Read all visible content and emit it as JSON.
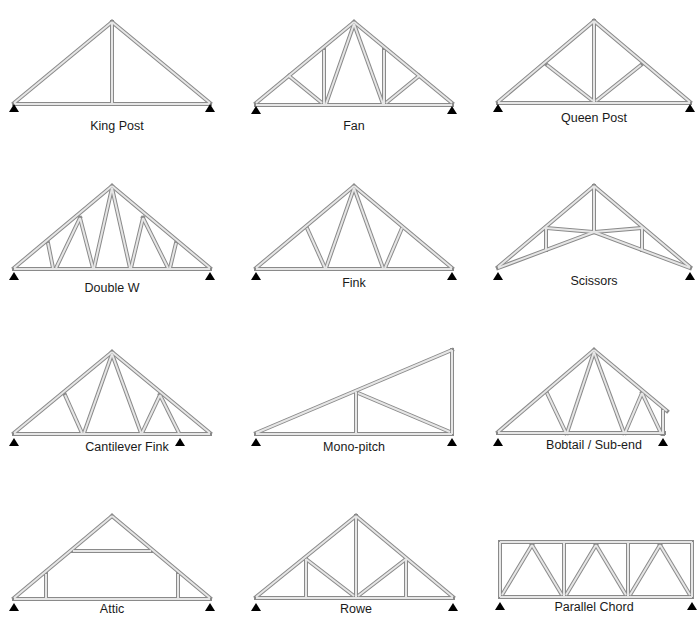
{
  "diagram": {
    "style": {
      "member_outline": "#8a8a8a",
      "member_fill": "#e6e6e6",
      "member_width": 4,
      "support_color": "#000000",
      "label_color": "#1a1a1a"
    },
    "trusses": [
      {
        "name": "King Post",
        "label_pos": [
          117,
          128
        ],
        "supports": [
          [
            14,
            106
          ],
          [
            210,
            106
          ]
        ],
        "members": [
          [
            [
              14,
              103
            ],
            [
              112,
              22
            ]
          ],
          [
            [
              112,
              22
            ],
            [
              210,
              103
            ]
          ],
          [
            [
              14,
              104
            ],
            [
              210,
              104
            ]
          ],
          [
            [
              112,
              22
            ],
            [
              112,
              104
            ]
          ]
        ]
      },
      {
        "name": "Fan",
        "label_pos": [
          354,
          128
        ],
        "supports": [
          [
            256,
            108
          ],
          [
            452,
            108
          ]
        ],
        "members": [
          [
            [
              256,
              103
            ],
            [
              354,
              22
            ]
          ],
          [
            [
              354,
              22
            ],
            [
              452,
              103
            ]
          ],
          [
            [
              256,
              105
            ],
            [
              452,
              105
            ]
          ],
          [
            [
              289,
              76
            ],
            [
              322,
              103
            ]
          ],
          [
            [
              324,
              50
            ],
            [
              324,
              104
            ]
          ],
          [
            [
              354,
              24
            ],
            [
              326,
              104
            ]
          ],
          [
            [
              354,
              24
            ],
            [
              383,
              104
            ]
          ],
          [
            [
              384,
              50
            ],
            [
              384,
              104
            ]
          ],
          [
            [
              419,
              76
            ],
            [
              386,
              103
            ]
          ]
        ]
      },
      {
        "name": "Queen Post",
        "label_pos": [
          594,
          120
        ],
        "supports": [
          [
            498,
            106
          ],
          [
            690,
            106
          ]
        ],
        "members": [
          [
            [
              498,
              102
            ],
            [
              594,
              21
            ]
          ],
          [
            [
              594,
              21
            ],
            [
              690,
              102
            ]
          ],
          [
            [
              498,
              103
            ],
            [
              690,
              103
            ]
          ],
          [
            [
              594,
              21
            ],
            [
              594,
              103
            ]
          ],
          [
            [
              547,
              65
            ],
            [
              593,
              101
            ]
          ],
          [
            [
              641,
              65
            ],
            [
              596,
              101
            ]
          ]
        ]
      }
    ],
    "trusses_row2": [
      {
        "name": "Double W",
        "label_pos": [
          112,
          290
        ],
        "supports": [
          [
            14,
            274
          ],
          [
            210,
            274
          ]
        ],
        "members": [
          [
            [
              14,
              268
            ],
            [
              112,
              186
            ]
          ],
          [
            [
              112,
              186
            ],
            [
              210,
              268
            ]
          ],
          [
            [
              14,
              269
            ],
            [
              210,
              269
            ]
          ],
          [
            [
              48,
              243
            ],
            [
              53,
              268
            ]
          ],
          [
            [
              80,
              218
            ],
            [
              56,
              268
            ]
          ],
          [
            [
              80,
              218
            ],
            [
              93,
              268
            ]
          ],
          [
            [
              112,
              188
            ],
            [
              94,
              268
            ]
          ],
          [
            [
              112,
              188
            ],
            [
              130,
              268
            ]
          ],
          [
            [
              143,
              218
            ],
            [
              131,
              268
            ]
          ],
          [
            [
              143,
              218
            ],
            [
              168,
              268
            ]
          ],
          [
            [
              176,
              243
            ],
            [
              170,
              268
            ]
          ]
        ]
      },
      {
        "name": "Fink",
        "label_pos": [
          354,
          285
        ],
        "supports": [
          [
            256,
            274
          ],
          [
            452,
            274
          ]
        ],
        "members": [
          [
            [
              256,
              268
            ],
            [
              354,
              186
            ]
          ],
          [
            [
              354,
              186
            ],
            [
              452,
              268
            ]
          ],
          [
            [
              256,
              269
            ],
            [
              452,
              269
            ]
          ],
          [
            [
              307,
              228
            ],
            [
              325,
              268
            ]
          ],
          [
            [
              354,
              188
            ],
            [
              326,
              268
            ]
          ],
          [
            [
              354,
              188
            ],
            [
              383,
              268
            ]
          ],
          [
            [
              402,
              228
            ],
            [
              385,
              268
            ]
          ]
        ]
      },
      {
        "name": "Scissors",
        "label_pos": [
          594,
          283
        ],
        "supports": [
          [
            498,
            274
          ],
          [
            690,
            274
          ]
        ],
        "members": [
          [
            [
              498,
              267
            ],
            [
              594,
              186
            ]
          ],
          [
            [
              594,
              186
            ],
            [
              690,
              267
            ]
          ],
          [
            [
              498,
              268
            ],
            [
              594,
              232
            ]
          ],
          [
            [
              594,
              232
            ],
            [
              690,
              268
            ]
          ],
          [
            [
              594,
              186
            ],
            [
              594,
              232
            ]
          ],
          [
            [
              546,
              228
            ],
            [
              594,
              232
            ]
          ],
          [
            [
              642,
              228
            ],
            [
              594,
              232
            ]
          ],
          [
            [
              546,
              228
            ],
            [
              546,
              250
            ]
          ],
          [
            [
              642,
              228
            ],
            [
              642,
              250
            ]
          ]
        ]
      }
    ],
    "trusses_row3": [
      {
        "name": "Cantilever Fink",
        "label_pos": [
          127,
          449
        ],
        "supports": [
          [
            14,
            440
          ],
          [
            180,
            440
          ]
        ],
        "members": [
          [
            [
              14,
              433
            ],
            [
              112,
              352
            ]
          ],
          [
            [
              112,
              352
            ],
            [
              210,
              433
            ]
          ],
          [
            [
              14,
              434
            ],
            [
              210,
              434
            ]
          ],
          [
            [
              65,
              395
            ],
            [
              82,
              433
            ]
          ],
          [
            [
              112,
              354
            ],
            [
              84,
              433
            ]
          ],
          [
            [
              112,
              354
            ],
            [
              141,
              433
            ]
          ],
          [
            [
              160,
              395
            ],
            [
              142,
              433
            ]
          ],
          [
            [
              160,
              395
            ],
            [
              179,
              433
            ]
          ]
        ]
      },
      {
        "name": "Mono-pitch",
        "label_pos": [
          354,
          449
        ],
        "supports": [
          [
            256,
            440
          ],
          [
            452,
            440
          ]
        ],
        "members": [
          [
            [
              256,
              433
            ],
            [
              452,
              350
            ]
          ],
          [
            [
              452,
              350
            ],
            [
              452,
              434
            ]
          ],
          [
            [
              256,
              434
            ],
            [
              452,
              434
            ]
          ],
          [
            [
              356,
              392
            ],
            [
              356,
              434
            ]
          ],
          [
            [
              358,
              393
            ],
            [
              450,
              432
            ]
          ]
        ]
      },
      {
        "name": "Bobtail / Sub-end",
        "label_pos": [
          594,
          447
        ],
        "supports": [
          [
            663,
            440
          ]
        ],
        "supports_left": [
          [
            498,
            440
          ]
        ],
        "members": [
          [
            [
              498,
              432
            ],
            [
              594,
              350
            ]
          ],
          [
            [
              594,
              350
            ],
            [
              667,
              411
            ]
          ],
          [
            [
              498,
              433
            ],
            [
              664,
              433
            ]
          ],
          [
            [
              547,
              393
            ],
            [
              566,
              433
            ]
          ],
          [
            [
              594,
              352
            ],
            [
              567,
              433
            ]
          ],
          [
            [
              594,
              352
            ],
            [
              624,
              433
            ]
          ],
          [
            [
              642,
              393
            ],
            [
              625,
              433
            ]
          ],
          [
            [
              642,
              393
            ],
            [
              661,
              433
            ]
          ],
          [
            [
              663,
              410
            ],
            [
              663,
              434
            ]
          ]
        ]
      }
    ],
    "trusses_row4": [
      {
        "name": "Attic",
        "label_pos": [
          112,
          611
        ],
        "supports": [
          [
            14,
            605
          ],
          [
            210,
            605
          ]
        ],
        "members": [
          [
            [
              14,
              598
            ],
            [
              112,
              516
            ]
          ],
          [
            [
              112,
              516
            ],
            [
              210,
              598
            ]
          ],
          [
            [
              14,
              599
            ],
            [
              210,
              599
            ]
          ],
          [
            [
              73,
              551
            ],
            [
              151,
              551
            ]
          ],
          [
            [
              46,
              574
            ],
            [
              46,
              599
            ]
          ],
          [
            [
              178,
              574
            ],
            [
              178,
              599
            ]
          ]
        ]
      },
      {
        "name": "Rowe",
        "label_pos": [
          356,
          611
        ],
        "supports": [
          [
            256,
            605
          ],
          [
            453,
            605
          ]
        ],
        "members": [
          [
            [
              256,
              597
            ],
            [
              356,
              516
            ]
          ],
          [
            [
              356,
              516
            ],
            [
              453,
              597
            ]
          ],
          [
            [
              256,
              598
            ],
            [
              453,
              598
            ]
          ],
          [
            [
              356,
              516
            ],
            [
              356,
              598
            ]
          ],
          [
            [
              306,
              559
            ],
            [
              306,
              598
            ]
          ],
          [
            [
              406,
              559
            ],
            [
              406,
              598
            ]
          ],
          [
            [
              306,
              559
            ],
            [
              354,
              596
            ]
          ],
          [
            [
              406,
              559
            ],
            [
              358,
              596
            ]
          ]
        ]
      },
      {
        "name": "Parallel Chord",
        "label_pos": [
          594,
          609
        ],
        "supports": [
          [
            500,
            604
          ],
          [
            692,
            604
          ]
        ],
        "members": [
          [
            [
              500,
              542
            ],
            [
              692,
              542
            ]
          ],
          [
            [
              500,
              597
            ],
            [
              692,
              597
            ]
          ],
          [
            [
              500,
              542
            ],
            [
              500,
              597
            ]
          ],
          [
            [
              564,
              542
            ],
            [
              564,
              597
            ]
          ],
          [
            [
              628,
              542
            ],
            [
              628,
              597
            ]
          ],
          [
            [
              692,
              542
            ],
            [
              692,
              597
            ]
          ],
          [
            [
              502,
              595
            ],
            [
              532,
              545
            ]
          ],
          [
            [
              532,
              545
            ],
            [
              562,
              595
            ]
          ],
          [
            [
              566,
              595
            ],
            [
              596,
              545
            ]
          ],
          [
            [
              596,
              545
            ],
            [
              626,
              595
            ]
          ],
          [
            [
              630,
              595
            ],
            [
              660,
              545
            ]
          ],
          [
            [
              660,
              545
            ],
            [
              690,
              595
            ]
          ]
        ]
      }
    ]
  }
}
